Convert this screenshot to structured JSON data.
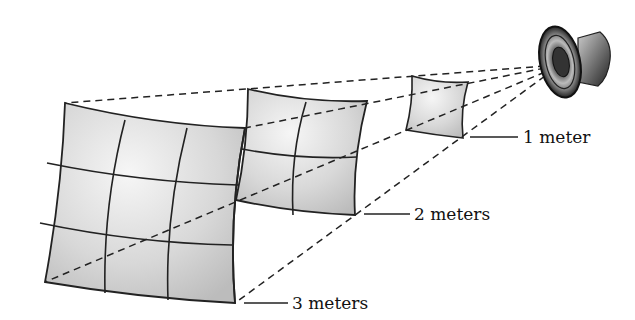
{
  "figure": {
    "source": "speaker",
    "labels": [
      {
        "id": "d1",
        "text": "1 meter"
      },
      {
        "id": "d2",
        "text": "2 meters"
      },
      {
        "id": "d3",
        "text": "3 meters"
      }
    ],
    "panels": [
      {
        "distance": "1 meter",
        "grid": "1x1"
      },
      {
        "distance": "2 meters",
        "grid": "2x2"
      },
      {
        "distance": "3 meters",
        "grid": "3x3"
      }
    ],
    "colors": {
      "panel_fill": "#d4d4d4",
      "panel_highlight": "#f2f2f2",
      "line": "#222222"
    }
  }
}
